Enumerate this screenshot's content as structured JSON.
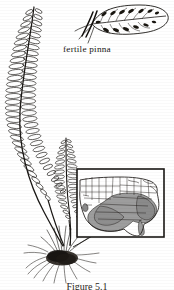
{
  "figure": {
    "kind": "botanical-illustration",
    "background_color": "#ffffff",
    "ink_color": "#1a1714",
    "caption": "Figure 5.1"
  },
  "labels": {
    "fertile_pinna": "fertile pinna"
  },
  "plant": {
    "large_frond": {
      "name": "large-sterile-frond",
      "pinna_pairs": 34,
      "description": "long arching frond with many small oval pinnae"
    },
    "small_frond": {
      "name": "small-fertile-frond",
      "pinna_pairs": 22,
      "description": "shorter upright frond"
    },
    "root_mass": {
      "name": "rhizome-root-cluster",
      "description": "dense dark fibrous root clump at plant base"
    }
  },
  "detail_inset": {
    "name": "fertile-pinna-detail",
    "sori_count": 14,
    "description": "enlarged elongate pinna bearing dark elliptic sori along the veins"
  },
  "map_inset": {
    "name": "us-distribution-map",
    "region": "United States",
    "shaded_region": "southeastern United States",
    "shade_color": "#9a9a9a",
    "border_color": "#1a1714",
    "box": {
      "x": 77,
      "y": 169,
      "width": 87,
      "height": 68
    }
  }
}
